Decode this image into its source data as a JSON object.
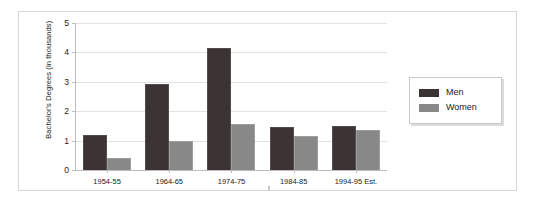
{
  "chart_data": {
    "type": "bar",
    "title": "",
    "subtitle": "",
    "xlabel": "",
    "ylabel": "Bachelor's Degrees (in thousands)",
    "categories": [
      "1954-55",
      "1964-65",
      "1974-75",
      "1984-85",
      "1994-95 Est."
    ],
    "series": [
      {
        "name": "Men",
        "color": "#3c3434",
        "values": [
          1.2,
          2.92,
          4.15,
          1.48,
          1.5
        ]
      },
      {
        "name": "Women",
        "color": "#888888",
        "values": [
          0.4,
          0.98,
          1.55,
          1.15,
          1.35
        ]
      }
    ],
    "ylim": [
      0,
      5
    ],
    "yticks": [
      0,
      1,
      2,
      3,
      4,
      5
    ],
    "ytick_labels": [
      "0",
      "1",
      "2",
      "3",
      "4",
      "5"
    ],
    "grid": true,
    "legend_position": "right",
    "legend_entries": [
      "Men",
      "Women"
    ]
  },
  "axes": {
    "y_title": "Bachelor's Degrees (in thousands)",
    "y_labels": [
      "5",
      "4",
      "3",
      "2",
      "1",
      "0"
    ],
    "x_labels": [
      "1954-55",
      "1964-65",
      "1974-75",
      "1984-85",
      "1994-95 Est."
    ]
  },
  "legend": {
    "men_label": "Men",
    "women_label": "Women"
  },
  "colors": {
    "men": "#3c3434",
    "women": "#888888",
    "grid": "#e2e2e2",
    "axis": "#bdbdbd",
    "frame": "#d7d7d7",
    "background": "#ffffff"
  }
}
